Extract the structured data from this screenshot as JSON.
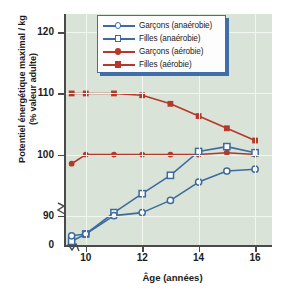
{
  "chart_data": {
    "type": "line",
    "title": "",
    "xlabel": "Âge (années)",
    "ylabel": "Potentiel énergétique maximal / kg (% valeur adulte)",
    "ylabel_line1": "Potentiel énergétique maximal / kg",
    "ylabel_line2": "(% valeur adulte)",
    "x": [
      9.5,
      10,
      11,
      12,
      13,
      14,
      15,
      16
    ],
    "xlim": [
      9.3,
      16.6
    ],
    "ylim": [
      85.2,
      123
    ],
    "xticks": [
      10,
      12,
      14,
      16
    ],
    "yticks": [
      90,
      100,
      110,
      120
    ],
    "ytick_labels": [
      "90",
      "100",
      "110",
      "120"
    ],
    "xtick_labels": [
      "10",
      "12",
      "14",
      "16"
    ],
    "y_origin_label": "0",
    "axis_break_y": true,
    "axis_break_x": true,
    "grid": true,
    "legend_position": "top-center",
    "plot_background": "#d9e3d8",
    "grid_color": "#f2f6f1",
    "series": [
      {
        "name": "Garçons (anaérobie)",
        "color": "#3d6b9e",
        "marker": "open-circle",
        "values": [
          86.7,
          87.0,
          90.0,
          90.5,
          92.5,
          95.5,
          97.3,
          97.6
        ]
      },
      {
        "name": "Filles (anaérobie)",
        "color": "#3d6b9e",
        "marker": "open-square",
        "values": [
          85.8,
          87.0,
          90.5,
          93.6,
          96.6,
          100.5,
          101.3,
          100.3
        ]
      },
      {
        "name": "Garçons (aérobie)",
        "color": "#b5382a",
        "marker": "filled-circle",
        "values": [
          98.5,
          100.0,
          100.0,
          100.0,
          100.0,
          100.0,
          100.3,
          100.0
        ]
      },
      {
        "name": "Filles (aérobie)",
        "color": "#b5382a",
        "marker": "filled-square",
        "values": [
          110.0,
          110.0,
          110.0,
          109.7,
          108.3,
          106.3,
          104.3,
          102.3
        ]
      }
    ]
  },
  "legend": {
    "items": [
      {
        "label": "Garçons (anaérobie)"
      },
      {
        "label": "Filles (anaérobie)"
      },
      {
        "label": "Garçons (aérobie)"
      },
      {
        "label": "Filles (aérobie)"
      }
    ],
    "border_color": "#3f6ea8"
  }
}
